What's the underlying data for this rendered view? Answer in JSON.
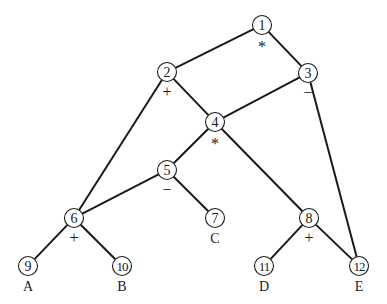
{
  "diagram": {
    "type": "expression-dag",
    "nodes": [
      {
        "id": "1",
        "x": 262,
        "y": 25,
        "op": "*"
      },
      {
        "id": "2",
        "x": 167,
        "y": 72,
        "op": "+"
      },
      {
        "id": "3",
        "x": 308,
        "y": 73,
        "op": "−"
      },
      {
        "id": "4",
        "x": 215,
        "y": 122,
        "op": "*"
      },
      {
        "id": "5",
        "x": 167,
        "y": 170,
        "op": "−"
      },
      {
        "id": "6",
        "x": 74,
        "y": 218,
        "op": "+"
      },
      {
        "id": "7",
        "x": 215,
        "y": 218,
        "leaf": "C"
      },
      {
        "id": "8",
        "x": 309,
        "y": 218,
        "op": "+"
      },
      {
        "id": "9",
        "x": 28,
        "y": 266,
        "leaf": "A"
      },
      {
        "id": "10",
        "x": 122,
        "y": 266,
        "leaf": "B"
      },
      {
        "id": "11",
        "x": 264,
        "y": 266,
        "leaf": "D"
      },
      {
        "id": "12",
        "x": 359,
        "y": 266,
        "leaf": "E"
      }
    ],
    "edges": [
      [
        "1",
        "2"
      ],
      [
        "1",
        "3"
      ],
      [
        "2",
        "4"
      ],
      [
        "2",
        "6"
      ],
      [
        "3",
        "4"
      ],
      [
        "3",
        "12"
      ],
      [
        "4",
        "5"
      ],
      [
        "4",
        "8"
      ],
      [
        "5",
        "6"
      ],
      [
        "5",
        "7"
      ],
      [
        "6",
        "9"
      ],
      [
        "6",
        "10"
      ],
      [
        "8",
        "11"
      ],
      [
        "8",
        "12"
      ]
    ],
    "colors": {
      "line": "#1a1a1a",
      "background": "#ffffff"
    }
  }
}
